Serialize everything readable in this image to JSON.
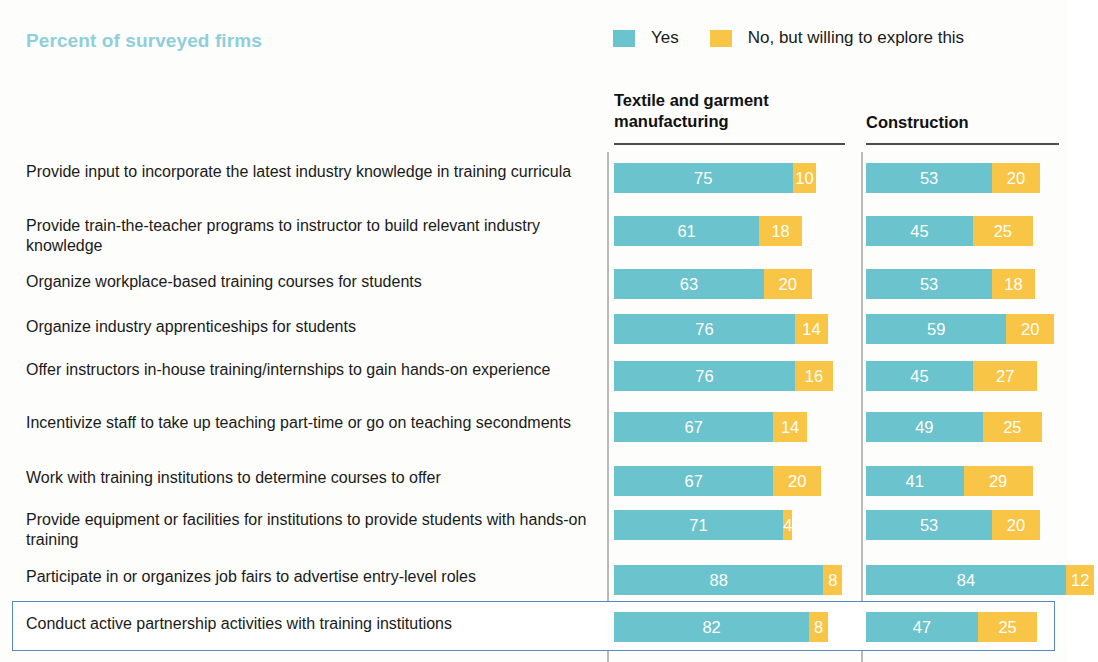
{
  "title": "Percent of surveyed firms",
  "legend": {
    "position": "top-right",
    "items": [
      {
        "label": "Yes",
        "color": "#6bc3cd",
        "key": "yes"
      },
      {
        "label": "No, but willing to explore this",
        "color": "#f9c547",
        "key": "no"
      }
    ]
  },
  "columns": [
    {
      "key": "textile",
      "header": "Textile and garment manufacturing"
    },
    {
      "key": "construction",
      "header": "Construction"
    }
  ],
  "highlighted_row_index": 9,
  "chart_data": {
    "type": "bar",
    "title": "Percent of surveyed firms",
    "subtitle": "",
    "xlabel": "",
    "ylabel": "",
    "orientation": "horizontal",
    "stacked": true,
    "grid": false,
    "legend_position": "top-right",
    "xlim": [
      0,
      100
    ],
    "panels": [
      "Textile and garment manufacturing",
      "Construction"
    ],
    "categories": [
      "Provide input to incorporate the latest industry knowledge in training curricula",
      "Provide train-the-teacher programs to instructor to build relevant industry knowledge",
      "Organize workplace-based training courses for students",
      "Organize industry apprenticeships for students",
      "Offer instructors in-house training/internships to gain hands-on experience",
      "Incentivize staff to take up teaching part-time or go on teaching secondments",
      "Work with training institutions to determine courses to offer",
      "Provide equipment or facilities for institutions to provide students with hands-on training",
      "Participate in or organizes job fairs to advertise entry-level roles",
      "Conduct active partnership activities with training institutions"
    ],
    "series": [
      {
        "name": "Yes",
        "panel": "Textile and garment manufacturing",
        "color": "#6bc3cd",
        "values": [
          75,
          61,
          63,
          76,
          76,
          67,
          67,
          71,
          88,
          82
        ]
      },
      {
        "name": "No, but willing to explore this",
        "panel": "Textile and garment manufacturing",
        "color": "#f9c547",
        "values": [
          10,
          18,
          20,
          14,
          16,
          14,
          20,
          4,
          8,
          8
        ]
      },
      {
        "name": "Yes",
        "panel": "Construction",
        "color": "#6bc3cd",
        "values": [
          53,
          45,
          53,
          59,
          45,
          49,
          41,
          53,
          84,
          47
        ]
      },
      {
        "name": "No, but willing to explore this",
        "panel": "Construction",
        "color": "#f9c547",
        "values": [
          20,
          25,
          18,
          20,
          27,
          25,
          29,
          20,
          12,
          25
        ]
      }
    ]
  },
  "rows": [
    {
      "label": "Provide input to incorporate the latest industry knowledge in training curricula",
      "lines": 2,
      "textile": {
        "yes": 75,
        "no": 10
      },
      "construction": {
        "yes": 53,
        "no": 20
      }
    },
    {
      "label": "Provide train-the-teacher programs to instructor to build relevant industry knowledge",
      "lines": 2,
      "textile": {
        "yes": 61,
        "no": 18
      },
      "construction": {
        "yes": 45,
        "no": 25
      }
    },
    {
      "label": "Organize workplace-based training courses for students",
      "lines": 1,
      "textile": {
        "yes": 63,
        "no": 20
      },
      "construction": {
        "yes": 53,
        "no": 18
      }
    },
    {
      "label": "Organize industry apprenticeships for students",
      "lines": 1,
      "textile": {
        "yes": 76,
        "no": 14
      },
      "construction": {
        "yes": 59,
        "no": 20
      }
    },
    {
      "label": "Offer instructors in-house training/internships to gain hands-on experience",
      "lines": 2,
      "textile": {
        "yes": 76,
        "no": 16
      },
      "construction": {
        "yes": 45,
        "no": 27
      }
    },
    {
      "label": "Incentivize staff to take up teaching part-time or go on teaching secondments",
      "lines": 2,
      "textile": {
        "yes": 67,
        "no": 14
      },
      "construction": {
        "yes": 49,
        "no": 25
      }
    },
    {
      "label": "Work with training institutions to determine courses to offer",
      "lines": 1,
      "textile": {
        "yes": 67,
        "no": 20
      },
      "construction": {
        "yes": 41,
        "no": 29
      }
    },
    {
      "label": "Provide equipment or facilities for institutions to provide students with hands-on training",
      "lines": 2,
      "textile": {
        "yes": 71,
        "no": 4
      },
      "construction": {
        "yes": 53,
        "no": 20
      }
    },
    {
      "label": "Participate in or organizes job fairs to advertise entry-level roles",
      "lines": 1,
      "textile": {
        "yes": 88,
        "no": 8
      },
      "construction": {
        "yes": 84,
        "no": 12
      }
    },
    {
      "label": "Conduct active partnership activities with training institutions",
      "lines": 1,
      "textile": {
        "yes": 82,
        "no": 8
      },
      "construction": {
        "yes": 47,
        "no": 25
      }
    }
  ]
}
